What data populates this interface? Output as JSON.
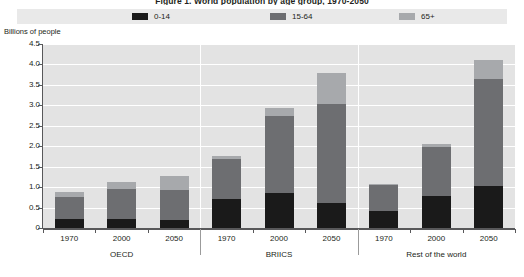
{
  "chart_data": {
    "type": "bar",
    "subtype": "stacked-bar-grouped",
    "title": "Figure 1. World population by age group, 1970-2050",
    "ylabel": "Billions of people",
    "xlabel": "",
    "ylim": [
      0,
      4.5
    ],
    "ytick_step": 0.5,
    "ytick_labels": [
      "4.5",
      "4.0",
      "3.5",
      "3.0",
      "2.5",
      "2.0",
      "1.5",
      "1.0",
      "0.5",
      "0"
    ],
    "ytick_values": [
      4.5,
      4.0,
      3.5,
      3.0,
      2.5,
      2.0,
      1.5,
      1.0,
      0.5,
      0
    ],
    "grid": true,
    "grid_orientation": "horizontal",
    "legend_position": "top",
    "plot_background": "#e3e3e3",
    "groups": [
      "OECD",
      "BRIICS",
      "Rest of the world"
    ],
    "categories": [
      "1970",
      "2000",
      "2050",
      "1970",
      "2000",
      "2050",
      "1970",
      "2000",
      "2050"
    ],
    "series": [
      {
        "name": "0-14",
        "color": "#1a1a1a",
        "values": [
          0.22,
          0.21,
          0.19,
          0.7,
          0.86,
          0.62,
          0.42,
          0.78,
          1.02
        ]
      },
      {
        "name": "15-64",
        "color": "#6d6e71",
        "values": [
          0.55,
          0.74,
          0.75,
          1.0,
          1.88,
          2.42,
          0.62,
          1.2,
          2.62
        ]
      },
      {
        "name": "65+",
        "color": "#a7a9ac",
        "values": [
          0.11,
          0.17,
          0.34,
          0.07,
          0.2,
          0.74,
          0.03,
          0.07,
          0.46
        ]
      }
    ],
    "totals": [
      0.88,
      1.12,
      1.28,
      1.77,
      2.94,
      3.78,
      1.07,
      2.05,
      4.1
    ]
  },
  "legend": {
    "items": [
      {
        "label": "0-14",
        "color": "#1a1a1a"
      },
      {
        "label": "15-64",
        "color": "#6d6e71"
      },
      {
        "label": "65+",
        "color": "#a7a9ac"
      }
    ]
  },
  "axis": {
    "y_title": "Billions of people"
  }
}
